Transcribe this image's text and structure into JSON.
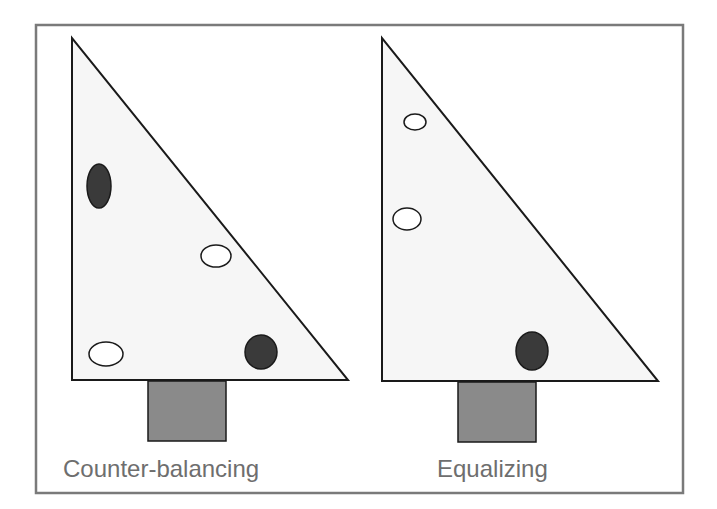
{
  "figure": {
    "panels": [
      {
        "label": "Counter-balancing",
        "triangle": {
          "points": "72,38 72,380 348,380"
        },
        "stand": {
          "x": 148,
          "y": 381,
          "w": 78,
          "h": 60
        },
        "objects": [
          {
            "type": "filled",
            "cx": 99,
            "cy": 186,
            "rx": 12,
            "ry": 22
          },
          {
            "type": "hollow",
            "cx": 216,
            "cy": 256,
            "rx": 15,
            "ry": 11
          },
          {
            "type": "hollow",
            "cx": 106,
            "cy": 354,
            "rx": 17,
            "ry": 12
          },
          {
            "type": "filled",
            "cx": 261,
            "cy": 352,
            "rx": 16,
            "ry": 17
          }
        ]
      },
      {
        "label": "Equalizing",
        "triangle": {
          "points": "382,38 382,381 658,381"
        },
        "stand": {
          "x": 458,
          "y": 382,
          "w": 78,
          "h": 60
        },
        "objects": [
          {
            "type": "hollow",
            "cx": 415,
            "cy": 122,
            "rx": 11,
            "ry": 8
          },
          {
            "type": "hollow",
            "cx": 407,
            "cy": 219,
            "rx": 14,
            "ry": 11
          },
          {
            "type": "filled",
            "cx": 532,
            "cy": 351,
            "rx": 16,
            "ry": 19
          }
        ]
      }
    ],
    "colors": {
      "frame": "#7a7a7a",
      "triangle_fill": "#f6f6f6",
      "outline": "#1a1a1a",
      "filled_object": "#3a3a3a",
      "hollow_object": "#ffffff",
      "stand": "#8a8a8a",
      "label_text": "#6e6e6e"
    }
  }
}
